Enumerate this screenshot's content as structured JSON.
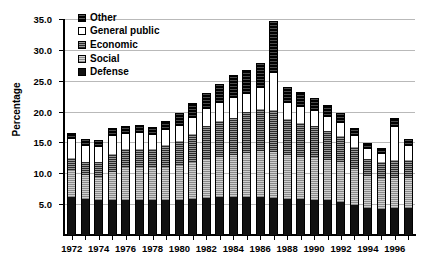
{
  "chart_data": {
    "type": "bar",
    "subtype": "stacked-vertical",
    "title": "",
    "xlabel": "",
    "ylabel": "Percentage",
    "ylim": [
      0.0,
      35.0
    ],
    "ytick_step": 5.0,
    "ytick_labels": [
      "35.0",
      "30.0",
      "25.0",
      "20.0",
      "15.0",
      "10.0",
      "5.0"
    ],
    "ytick_values": [
      35.0,
      30.0,
      25.0,
      20.0,
      15.0,
      10.0,
      5.0
    ],
    "grid": "horizontal",
    "legend_position": "top-left",
    "categories": [
      "1972",
      "1973",
      "1974",
      "1975",
      "1976",
      "1977",
      "1978",
      "1979",
      "1980",
      "1981",
      "1982",
      "1983",
      "1984",
      "1985",
      "1986",
      "1987",
      "1988",
      "1989",
      "1990",
      "1991",
      "1992",
      "1993",
      "1994",
      "1995",
      "1996",
      "1997"
    ],
    "xtick_labels": [
      "1972",
      "1974",
      "1976",
      "1978",
      "1980",
      "1982",
      "1984",
      "1986",
      "1988",
      "1990",
      "1992",
      "1994",
      "1996"
    ],
    "series": [
      {
        "name": "Defense",
        "values": [
          6.2,
          5.9,
          5.6,
          5.6,
          5.6,
          5.6,
          5.6,
          5.6,
          5.6,
          5.8,
          6.0,
          6.1,
          6.2,
          6.2,
          6.1,
          6.0,
          5.9,
          5.8,
          5.7,
          5.6,
          5.4,
          4.9,
          4.4,
          4.2,
          4.3,
          4.3
        ]
      },
      {
        "name": "Social",
        "values": [
          4.3,
          3.8,
          3.8,
          4.6,
          5.5,
          5.5,
          5.4,
          5.5,
          5.7,
          6.0,
          6.4,
          6.5,
          6.8,
          7.1,
          7.5,
          7.4,
          7.1,
          6.9,
          6.9,
          6.6,
          6.4,
          5.8,
          5.2,
          5.0,
          5.0,
          5.0
        ]
      },
      {
        "name": "Economic",
        "values": [
          2.0,
          2.2,
          2.5,
          2.9,
          2.9,
          2.9,
          3.0,
          3.5,
          3.9,
          4.5,
          5.3,
          5.8,
          6.0,
          6.6,
          6.9,
          6.9,
          5.8,
          5.5,
          5.1,
          4.6,
          4.2,
          3.5,
          2.8,
          2.6,
          2.8,
          2.9
        ]
      },
      {
        "name": "General public",
        "values": [
          3.0,
          2.6,
          2.4,
          3.0,
          2.4,
          2.6,
          2.2,
          2.5,
          2.4,
          2.6,
          2.7,
          3.0,
          3.2,
          3.0,
          3.4,
          5.9,
          2.6,
          2.6,
          2.4,
          2.3,
          2.1,
          1.8,
          1.5,
          1.4,
          5.4,
          2.2
        ]
      },
      {
        "name": "Other",
        "values": [
          1.0,
          1.0,
          1.1,
          1.2,
          1.2,
          1.3,
          1.3,
          1.4,
          2.1,
          2.5,
          2.6,
          3.1,
          3.7,
          3.8,
          3.9,
          8.5,
          2.6,
          2.3,
          2.1,
          1.9,
          1.7,
          1.4,
          1.0,
          0.9,
          1.4,
          1.2
        ]
      }
    ],
    "totals": [
      16.5,
      15.5,
      15.4,
      17.3,
      17.6,
      17.9,
      17.5,
      18.5,
      19.7,
      21.4,
      23.0,
      24.5,
      25.9,
      26.7,
      27.8,
      34.7,
      24.0,
      23.1,
      22.2,
      21.0,
      19.8,
      17.4,
      14.9,
      14.1,
      18.9,
      15.6
    ],
    "colors": {
      "Defense": "#111111",
      "Social": "#c2c2c2",
      "Economic": "#6e6e6e",
      "General public": "#ffffff",
      "Other": "#2a2a2a",
      "gridline": "#b9b9b9",
      "axis": "#000000"
    }
  },
  "legend": {
    "items": [
      {
        "label": "Other",
        "swatch": "sw-other"
      },
      {
        "label": "General public",
        "swatch": "sw-general"
      },
      {
        "label": "Economic",
        "swatch": "sw-economic"
      },
      {
        "label": "Social",
        "swatch": "sw-social"
      },
      {
        "label": "Defense",
        "swatch": "sw-defense"
      }
    ]
  }
}
